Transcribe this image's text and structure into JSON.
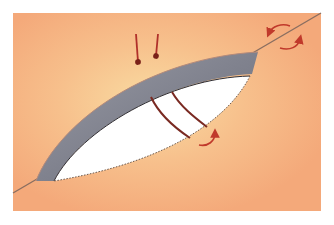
{
  "diagram": {
    "type": "geology-cross-section",
    "colors": {
      "background": "#ffffff",
      "rock": "#f4a97a",
      "rock_glow": "#f9d9a0",
      "fault_line": "#8a6a5a",
      "vein_band": "#8a8c98",
      "vein_band_dark": "#5c5e6c",
      "cavity": "#ffffff",
      "arrow": "#b0302a",
      "fracture": "#7a2a22"
    },
    "elements": {
      "fault_line": "fault-line",
      "vein_band": "gray-vein-band",
      "cavity": "open-lens-cavity",
      "fractures": 2,
      "compression_arrows": 2,
      "shear_arrows_upper_right": 2,
      "shear_arrow_lower": 1
    }
  }
}
